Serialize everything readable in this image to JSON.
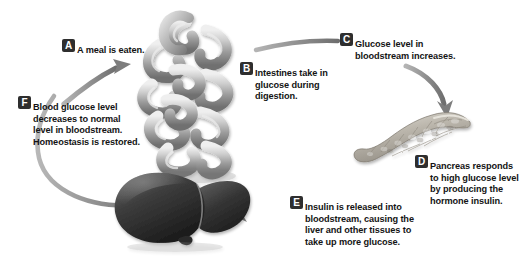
{
  "diagram": {
    "background_color": "#ffffff",
    "badge_color": "#2e2e2e",
    "badge_text_color": "#ffffff",
    "text_color": "#141414",
    "arrow_color": "#8a8a8a"
  },
  "steps": [
    {
      "key": "A",
      "badge": "A",
      "text": "A meal is eaten.",
      "lines": [
        "A meal is eaten."
      ]
    },
    {
      "key": "B",
      "badge": "B",
      "text": "Intestines take in glucose during digestion.",
      "lines": [
        "Intestines take in",
        "glucose during",
        "digestion."
      ]
    },
    {
      "key": "C",
      "badge": "C",
      "text": "Glucose level in bloodstream increases.",
      "lines": [
        "Glucose level in",
        "bloodstream increases."
      ]
    },
    {
      "key": "D",
      "badge": "D",
      "text": "Pancreas responds to high glucose level by producing the hormone insulin.",
      "lines": [
        "Pancreas responds",
        "to high glucose level",
        "by producing the",
        "hormone insulin."
      ]
    },
    {
      "key": "E",
      "badge": "E",
      "text": "Insulin is released into bloodstream, causing the liver and other tissues to take up more glucose.",
      "lines": [
        "Insulin is released into",
        "bloodstream, causing the",
        "liver and other tissues to",
        "take up more glucose."
      ]
    },
    {
      "key": "F",
      "badge": "F",
      "text": "Blood glucose level decreases to normal level in bloodstream. Homeostasis is restored.",
      "lines": [
        "Blood glucose level",
        "decreases to normal",
        "level in bloodstream.",
        "Homeostasis is restored."
      ]
    }
  ],
  "organs": [
    {
      "key": "intestines",
      "name": "intestines-illustration",
      "label": "Intestines"
    },
    {
      "key": "pancreas",
      "name": "pancreas-illustration",
      "label": "Pancreas"
    },
    {
      "key": "liver",
      "name": "liver-illustration",
      "label": "Liver"
    }
  ],
  "connectors": [
    {
      "key": "a",
      "name": "arrow-meal-to-intestines",
      "from": "F",
      "to": "intestines",
      "arrowhead": true
    },
    {
      "key": "c",
      "name": "line-intestines-to-glucose-level",
      "from": "intestines",
      "to": "C",
      "arrowhead": false
    },
    {
      "key": "d",
      "name": "arrow-glucose-level-to-pancreas",
      "from": "C",
      "to": "pancreas",
      "arrowhead": true
    },
    {
      "key": "e",
      "name": "arrow-insulin-to-liver",
      "from": "pancreas",
      "to": "liver",
      "arrowhead": true
    },
    {
      "key": "f",
      "name": "line-liver-to-meal",
      "from": "liver",
      "to": "A",
      "arrowhead": false
    }
  ]
}
